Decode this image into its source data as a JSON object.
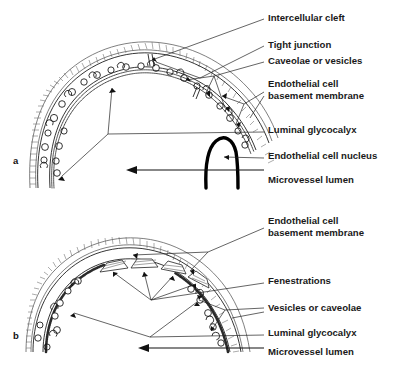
{
  "figure": {
    "title_present": false,
    "background_color": "#ffffff",
    "ink_color": "#111111",
    "panels": [
      {
        "id": "a",
        "panel_label": "a",
        "description": "Continuous capillary microvessel wall cross-section",
        "labels": [
          {
            "key": "intercellular_cleft",
            "text": "Intercellular cleft",
            "x": 268,
            "y": 21
          },
          {
            "key": "tight_junction",
            "text": "Tight junction",
            "x": 268,
            "y": 48
          },
          {
            "key": "caveolae_or_vesicles",
            "text": "Caveolae or vesicles",
            "x": 268,
            "y": 64
          },
          {
            "key": "endothelial_cell",
            "text": "Endothelial cell",
            "x": 268,
            "y": 87
          },
          {
            "key": "basement_membrane",
            "text": "basement membrane",
            "x": 268,
            "y": 99
          },
          {
            "key": "luminal_glycocalyx",
            "text": "Luminal glycocalyx",
            "x": 268,
            "y": 133
          },
          {
            "key": "endothelial_cell_nucleus",
            "text": "Endothelial cell nucleus",
            "x": 268,
            "y": 159
          },
          {
            "key": "microvessel_lumen",
            "text": "Microvessel lumen",
            "x": 268,
            "y": 183
          }
        ]
      },
      {
        "id": "b",
        "panel_label": "b",
        "description": "Fenestrated microvessel wall cross-section",
        "labels": [
          {
            "key": "endothelial_cell_b",
            "text": "Endothelial cell",
            "x": 268,
            "y": 224
          },
          {
            "key": "basement_membrane_b",
            "text": "basement membrane",
            "x": 268,
            "y": 236
          },
          {
            "key": "fenestrations",
            "text": "Fenestrations",
            "x": 268,
            "y": 284
          },
          {
            "key": "vesicles_or_caveolae",
            "text": "Vesicles or caveolae",
            "x": 268,
            "y": 311
          },
          {
            "key": "luminal_glycocalyx_b",
            "text": "Luminal glycocalyx",
            "x": 268,
            "y": 336
          },
          {
            "key": "microvessel_lumen_b",
            "text": "Microvessel lumen",
            "x": 268,
            "y": 355
          }
        ]
      }
    ]
  }
}
